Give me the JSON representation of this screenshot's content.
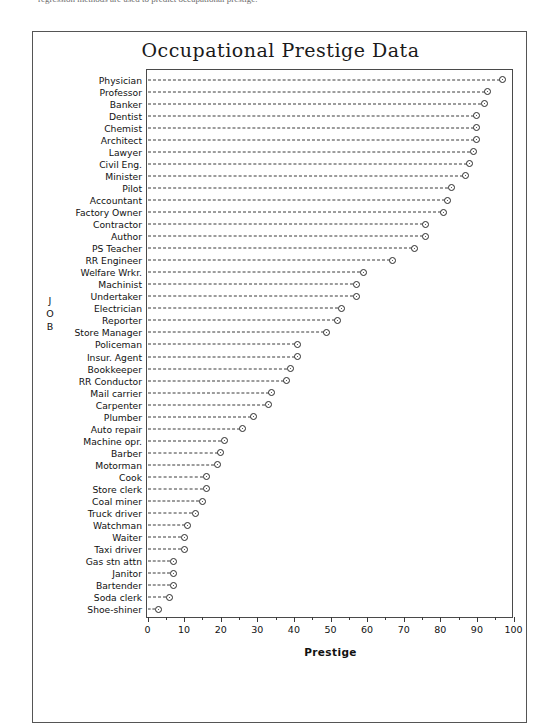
{
  "page": {
    "caption_fragment": "regression methods are used to predict occupational prestige."
  },
  "figure": {
    "title": "Occupational Prestige Data",
    "yaxis_title_letters": [
      "J",
      "O",
      "B"
    ]
  },
  "chart_data": {
    "type": "scatter",
    "orientation": "horizontal",
    "title": "Occupational Prestige Data",
    "xlabel": "Prestige",
    "ylabel": "JOB",
    "xlim": [
      0,
      100
    ],
    "xticks": [
      0,
      10,
      20,
      30,
      40,
      50,
      60,
      70,
      80,
      90,
      100
    ],
    "xticklabels": [
      "0",
      "10",
      "20",
      "30",
      "40",
      "50",
      "60",
      "70",
      "80",
      "90",
      "100"
    ],
    "minor_xticks": [
      5,
      15,
      25,
      35,
      45,
      55,
      65,
      75,
      85,
      95
    ],
    "grid": false,
    "leader_lines": true,
    "legend": null,
    "categories": [
      "Physician",
      "Professor",
      "Banker",
      "Dentist",
      "Chemist",
      "Architect",
      "Lawyer",
      "Civil Eng.",
      "Minister",
      "Pilot",
      "Accountant",
      "Factory Owner",
      "Contractor",
      "Author",
      "PS Teacher",
      "RR Engineer",
      "Welfare Wrkr.",
      "Machinist",
      "Undertaker",
      "Electrician",
      "Reporter",
      "Store Manager",
      "Policeman",
      "Insur. Agent",
      "Bookkeeper",
      "RR Conductor",
      "Mail carrier",
      "Carpenter",
      "Plumber",
      "Auto repair",
      "Machine opr.",
      "Barber",
      "Motorman",
      "Cook",
      "Store clerk",
      "Coal miner",
      "Truck driver",
      "Watchman",
      "Waiter",
      "Taxi driver",
      "Gas stn attn",
      "Janitor",
      "Bartender",
      "Soda clerk",
      "Shoe-shiner"
    ],
    "values": [
      97,
      93,
      92,
      90,
      90,
      90,
      89,
      88,
      87,
      83,
      82,
      81,
      76,
      76,
      73,
      67,
      59,
      57,
      57,
      53,
      52,
      49,
      41,
      41,
      39,
      38,
      34,
      33,
      29,
      26,
      21,
      20,
      19,
      16,
      16,
      15,
      13,
      11,
      10,
      10,
      7,
      7,
      7,
      6,
      3
    ],
    "marker": "circle-dot"
  }
}
